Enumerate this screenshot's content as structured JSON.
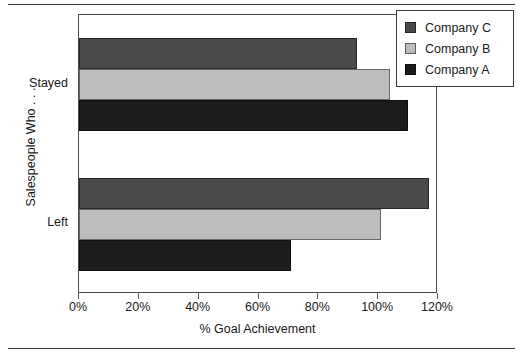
{
  "chart_data": {
    "type": "bar",
    "orientation": "horizontal",
    "title": "",
    "xlabel": "% Goal Achievement",
    "ylabel": "Salespeople Who . . .",
    "categories": [
      "Stayed",
      "Left"
    ],
    "series": [
      {
        "name": "Company A",
        "color": "#1c1c1c",
        "values": [
          110,
          71
        ]
      },
      {
        "name": "Company B",
        "color": "#bdbdbd",
        "values": [
          104,
          101
        ]
      },
      {
        "name": "Company C",
        "color": "#4a4a4a",
        "values": [
          93,
          117
        ]
      }
    ],
    "series_draw_order": [
      "Company C",
      "Company B",
      "Company A"
    ],
    "xlim": [
      0,
      120
    ],
    "xticks": [
      0,
      20,
      40,
      60,
      80,
      100,
      120
    ],
    "xtick_labels": [
      "0%",
      "20%",
      "40%",
      "60%",
      "80%",
      "100%",
      "120%"
    ],
    "grid": false,
    "legend_position": "top-right",
    "legend_entries": [
      "Company C",
      "Company B",
      "Company A"
    ]
  },
  "figure": {
    "top_rule": "",
    "bottom_rule": ""
  }
}
